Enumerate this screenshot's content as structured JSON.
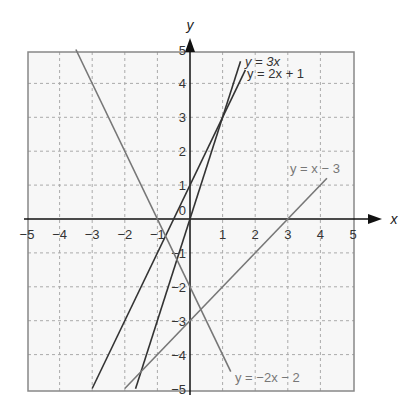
{
  "chart_data": {
    "type": "line",
    "title": "",
    "xlabel": "x",
    "ylabel": "y",
    "xlim": [
      -5,
      5
    ],
    "ylim": [
      -5,
      5
    ],
    "grid": true,
    "x_ticks": [
      "-5",
      "-4",
      "-3",
      "-2",
      "-1",
      "0",
      "1",
      "2",
      "3",
      "4",
      "5"
    ],
    "y_ticks": [
      "5",
      "4",
      "3",
      "2",
      "1",
      "0",
      "-1",
      "-2",
      "-3",
      "-4",
      "-5"
    ],
    "series": [
      {
        "name": "y = 3x",
        "slope": 3,
        "intercept": 0,
        "x_range": [
          -1.67,
          1.55
        ],
        "color": "#333333"
      },
      {
        "name": "y = 2x + 1",
        "slope": 2,
        "intercept": 1,
        "x_range": [
          -3,
          1.7
        ],
        "color": "#333333"
      },
      {
        "name": "y = x - 3",
        "slope": 1,
        "intercept": -3,
        "x_range": [
          -2,
          4.2
        ],
        "color": "#777777"
      },
      {
        "name": "y = -2x - 2",
        "slope": -2,
        "intercept": -2,
        "x_range": [
          -3.5,
          1.25
        ],
        "color": "#777777"
      }
    ]
  },
  "labels": {
    "y_axis": "y",
    "x_axis": "x",
    "eq1": "y = 3x",
    "eq2": "y = 2x + 1",
    "eq3": "y = x − 3",
    "eq4": "y = −2x − 2"
  }
}
